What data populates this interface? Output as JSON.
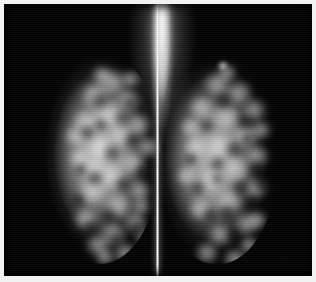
{
  "image": {
    "modality_label": "Mammogram",
    "view_type": "Bilateral craniocaudal mammogram",
    "panel_count": 2,
    "background_color": "#000000",
    "frame_color": "#f2f2f2",
    "divider_color": "#ffffff",
    "tissue_highlight_color": "#bdbdbd",
    "width_px": 316,
    "height_px": 282
  },
  "panels": [
    {
      "id": "left-view",
      "label": "Left breast view",
      "side": "left",
      "tissue_density": "heterogeneously dense fibroglandular tissue",
      "bounds": {
        "x": 30,
        "y": 48,
        "width": 128,
        "height": 212
      }
    },
    {
      "id": "right-view",
      "label": "Right breast view",
      "side": "right",
      "tissue_density": "heterogeneously dense fibroglandular tissue",
      "bounds": {
        "x": 150,
        "y": 48,
        "width": 126,
        "height": 212
      }
    }
  ],
  "features": {
    "superior_streak_label": "Superior bright chest-wall column",
    "divider_label": "Central separator line",
    "speck_label": "Isolated superior-lateral bright focus",
    "scanline_label": "Horizontal raster banding artifact"
  },
  "texture": {
    "left_bright_blobs": [
      [
        46,
        30,
        30,
        26
      ],
      [
        62,
        18,
        34,
        24
      ],
      [
        38,
        58,
        26,
        24
      ],
      [
        58,
        48,
        30,
        26
      ],
      [
        80,
        36,
        28,
        24
      ],
      [
        50,
        84,
        32,
        24
      ],
      [
        74,
        72,
        26,
        22
      ],
      [
        92,
        60,
        26,
        26
      ],
      [
        34,
        96,
        24,
        22
      ],
      [
        62,
        112,
        30,
        24
      ],
      [
        86,
        100,
        26,
        22
      ],
      [
        44,
        128,
        28,
        24
      ],
      [
        70,
        142,
        30,
        24
      ],
      [
        94,
        128,
        24,
        22
      ],
      [
        38,
        156,
        26,
        22
      ],
      [
        64,
        170,
        30,
        24
      ],
      [
        88,
        158,
        26,
        24
      ],
      [
        50,
        182,
        28,
        22
      ],
      [
        78,
        190,
        26,
        22
      ],
      [
        100,
        176,
        22,
        20
      ],
      [
        56,
        14,
        24,
        18
      ],
      [
        86,
        18,
        22,
        18
      ],
      [
        102,
        84,
        24,
        22
      ],
      [
        30,
        74,
        22,
        20
      ],
      [
        72,
        56,
        22,
        20
      ],
      [
        48,
        106,
        22,
        20
      ],
      [
        96,
        144,
        22,
        20
      ],
      [
        60,
        196,
        22,
        18
      ]
    ],
    "left_dark_blobs": [
      [
        56,
        40,
        20,
        18
      ],
      [
        78,
        58,
        18,
        16
      ],
      [
        44,
        72,
        18,
        16
      ],
      [
        68,
        92,
        20,
        18
      ],
      [
        90,
        80,
        16,
        16
      ],
      [
        52,
        118,
        18,
        16
      ],
      [
        80,
        124,
        18,
        16
      ],
      [
        36,
        140,
        16,
        16
      ],
      [
        66,
        156,
        18,
        16
      ],
      [
        94,
        168,
        16,
        16
      ],
      [
        48,
        168,
        16,
        14
      ],
      [
        74,
        180,
        16,
        14
      ],
      [
        88,
        44,
        16,
        14
      ],
      [
        60,
        66,
        14,
        14
      ],
      [
        40,
        110,
        14,
        14
      ],
      [
        100,
        112,
        16,
        14
      ]
    ],
    "right_bright_blobs": [
      [
        70,
        28,
        30,
        26
      ],
      [
        48,
        20,
        30,
        24
      ],
      [
        86,
        46,
        28,
        24
      ],
      [
        58,
        52,
        30,
        26
      ],
      [
        34,
        44,
        26,
        22
      ],
      [
        76,
        72,
        30,
        24
      ],
      [
        52,
        82,
        28,
        24
      ],
      [
        90,
        92,
        26,
        24
      ],
      [
        30,
        84,
        24,
        22
      ],
      [
        66,
        104,
        32,
        26
      ],
      [
        44,
        116,
        28,
        24
      ],
      [
        88,
        126,
        26,
        22
      ],
      [
        60,
        138,
        30,
        24
      ],
      [
        34,
        146,
        24,
        22
      ],
      [
        78,
        160,
        28,
        24
      ],
      [
        52,
        172,
        28,
        22
      ],
      [
        92,
        158,
        22,
        20
      ],
      [
        40,
        190,
        26,
        22
      ],
      [
        68,
        196,
        26,
        22
      ],
      [
        22,
        114,
        20,
        20
      ],
      [
        96,
        68,
        22,
        20
      ],
      [
        62,
        12,
        22,
        18
      ],
      [
        84,
        184,
        22,
        18
      ],
      [
        26,
        66,
        20,
        18
      ]
    ],
    "right_dark_blobs": [
      [
        60,
        40,
        20,
        18
      ],
      [
        82,
        62,
        18,
        16
      ],
      [
        44,
        66,
        18,
        16
      ],
      [
        70,
        88,
        20,
        18
      ],
      [
        94,
        108,
        16,
        16
      ],
      [
        54,
        104,
        18,
        16
      ],
      [
        78,
        128,
        18,
        16
      ],
      [
        36,
        128,
        16,
        16
      ],
      [
        64,
        152,
        18,
        16
      ],
      [
        90,
        142,
        16,
        16
      ],
      [
        48,
        156,
        16,
        14
      ],
      [
        72,
        176,
        16,
        14
      ],
      [
        56,
        120,
        14,
        14
      ],
      [
        86,
        80,
        14,
        14
      ],
      [
        30,
        100,
        14,
        14
      ],
      [
        100,
        126,
        16,
        14
      ]
    ]
  }
}
